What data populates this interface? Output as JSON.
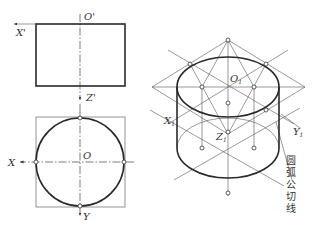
{
  "front_view": {
    "x_axis_label": "X'",
    "origin_label": "O'",
    "z_axis_label": "Z'"
  },
  "top_view": {
    "x_axis_label": "X",
    "origin_label": "O",
    "y_axis_label": "Y"
  },
  "isometric_view": {
    "top_center_label": "O",
    "top_center_sub": "1",
    "x_axis_label": "X",
    "x_axis_sub": "1",
    "y_axis_label": "Y",
    "y_axis_sub": "1",
    "z_axis_label": "Z",
    "z_axis_sub": "1",
    "annotation_chars": [
      "圆",
      "弧",
      "公",
      "切",
      "线"
    ]
  }
}
